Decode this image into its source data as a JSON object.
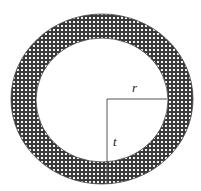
{
  "diagram": {
    "type": "annulus",
    "labels": {
      "radius": "r",
      "thickness": "t"
    },
    "colors": {
      "ring_fill": "#3a3a3a",
      "ring_dots": "#ffffff",
      "lines": "#555555",
      "background": "#ffffff"
    }
  }
}
